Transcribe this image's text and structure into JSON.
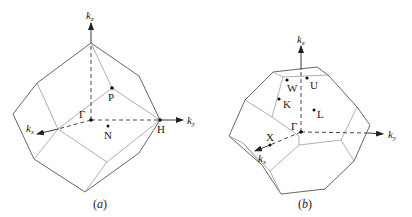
{
  "figure_a": {
    "caption_open": "(",
    "caption_letter": "a",
    "caption_close": ")",
    "axes": {
      "kz": "k",
      "kz_sub": "z",
      "ky": "k",
      "ky_sub": "y",
      "kx": "k",
      "kx_sub": "x"
    },
    "points": {
      "gamma": "Γ",
      "P": "P",
      "N": "N",
      "H": "H"
    },
    "description": "Brillouin zone of body-centered cubic lattice (rhombic dodecahedron)"
  },
  "figure_b": {
    "caption_open": "(",
    "caption_letter": "b",
    "caption_close": ")",
    "axes": {
      "kz": "k",
      "kz_sub": "z",
      "ky": "k",
      "ky_sub": "y",
      "kx": "k",
      "kx_sub": "x"
    },
    "points": {
      "gamma": "Γ",
      "W": "W",
      "U": "U",
      "K": "K",
      "L": "L",
      "X": "X"
    },
    "description": "Brillouin zone of face-centered cubic lattice (truncated octahedron)"
  },
  "colors": {
    "outer_edge": "#555555",
    "inner_edge": "#9a9a9a",
    "text": "#1a1a1a"
  }
}
